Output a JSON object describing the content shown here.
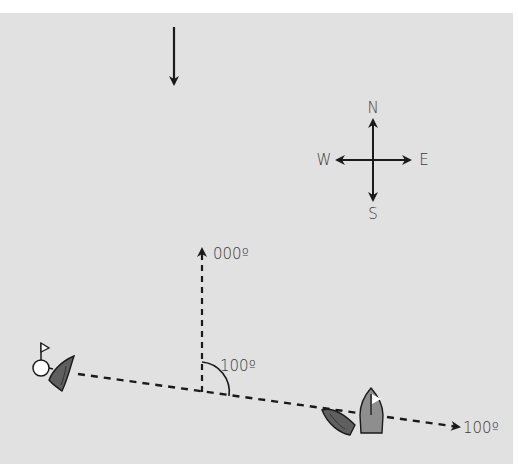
{
  "diagram": {
    "background": "#e1e1e1",
    "wind_arrow": {
      "direction": "down"
    },
    "compass": {
      "north": "N",
      "south": "S",
      "east": "E",
      "west": "W"
    },
    "heading_reference": {
      "label": "000º"
    },
    "angle": {
      "label": "100º"
    },
    "course_line": {
      "label": "100º"
    },
    "mark": {
      "type": "buoy-with-flag",
      "color": "#ffffff"
    },
    "boats": [
      {
        "id": "boat-left",
        "color": "#5f5f5f"
      },
      {
        "id": "boat-right-dark",
        "color": "#5f5f5f"
      },
      {
        "id": "boat-right-light",
        "color": "#8e8e8e",
        "flag": true
      }
    ]
  }
}
